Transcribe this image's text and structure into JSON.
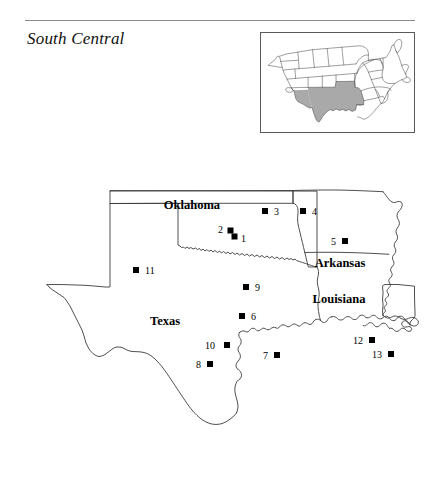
{
  "header": {
    "title": "South Central",
    "rule": true
  },
  "inset": {
    "name": "us-locator-map",
    "highlight_color": "#a9a9a9",
    "outline_color": "#4a4a4a",
    "border_color": "#595959",
    "highlighted_states": [
      "Texas",
      "Oklahoma",
      "Arkansas",
      "Louisiana"
    ]
  },
  "map": {
    "outline_color": "#3c3c3c",
    "marker_color": "#000000",
    "state_labels": [
      {
        "name": "Oklahoma",
        "label": "Oklahoma",
        "x": 192,
        "y": 54
      },
      {
        "name": "Arkansas",
        "label": "Arkansas",
        "x": 340,
        "y": 112
      },
      {
        "name": "Louisiana",
        "label": "Louisiana",
        "x": 339,
        "y": 148
      },
      {
        "name": "Texas",
        "label": "Texas",
        "x": 165,
        "y": 170
      }
    ],
    "markers": [
      {
        "id": "1",
        "label": "1",
        "x": 234.5,
        "y": 81.5,
        "label_x": 241,
        "label_y": 87,
        "label_side": "right"
      },
      {
        "id": "2",
        "label": "2",
        "x": 230.5,
        "y": 75.5,
        "label_x": 223,
        "label_y": 78,
        "label_side": "left"
      },
      {
        "id": "3",
        "label": "3",
        "x": 265,
        "y": 56,
        "label_x": 274,
        "label_y": 60,
        "label_side": "right"
      },
      {
        "id": "4",
        "label": "4",
        "x": 303,
        "y": 56,
        "label_x": 312,
        "label_y": 60,
        "label_side": "right"
      },
      {
        "id": "5",
        "label": "5",
        "x": 345,
        "y": 86,
        "label_x": 336,
        "label_y": 90,
        "label_side": "left"
      },
      {
        "id": "6",
        "label": "6",
        "x": 242,
        "y": 161,
        "label_x": 251,
        "label_y": 165,
        "label_side": "right"
      },
      {
        "id": "7",
        "label": "7",
        "x": 277,
        "y": 200,
        "label_x": 268,
        "label_y": 204,
        "label_side": "left"
      },
      {
        "id": "8",
        "label": "8",
        "x": 210,
        "y": 209,
        "label_x": 201,
        "label_y": 213,
        "label_side": "left"
      },
      {
        "id": "9",
        "label": "9",
        "x": 246,
        "y": 132,
        "label_x": 255,
        "label_y": 136,
        "label_side": "right"
      },
      {
        "id": "10",
        "label": "10",
        "x": 227,
        "y": 190,
        "label_x": 215,
        "label_y": 194,
        "label_side": "left"
      },
      {
        "id": "11",
        "label": "11",
        "x": 136,
        "y": 115,
        "label_x": 145,
        "label_y": 119,
        "label_side": "right"
      },
      {
        "id": "12",
        "label": "12",
        "x": 372,
        "y": 185,
        "label_x": 363,
        "label_y": 189,
        "label_side": "left"
      },
      {
        "id": "13",
        "label": "13",
        "x": 391,
        "y": 199,
        "label_x": 382,
        "label_y": 203,
        "label_side": "left"
      }
    ]
  }
}
